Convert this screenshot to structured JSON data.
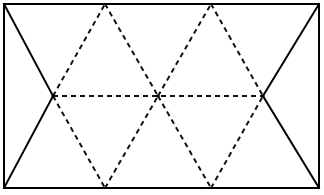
{
  "figure": {
    "background_color": "#ffffff",
    "solid_stroke_color": "#000000",
    "dashed_stroke_color": "#111111",
    "stroke_width": 2,
    "dash_pattern": "5 4",
    "canvas": {
      "width": 324,
      "height": 195
    },
    "points": {
      "top_left": {
        "x": 4,
        "y": 4,
        "label": "top-left-corner"
      },
      "top_apex_1": {
        "x": 105,
        "y": 4,
        "label": "top-apex-left"
      },
      "top_apex_2": {
        "x": 211,
        "y": 4,
        "label": "top-apex-right"
      },
      "top_right": {
        "x": 319,
        "y": 4,
        "label": "top-right-corner"
      },
      "mid_left": {
        "x": 53,
        "y": 96,
        "label": "mid-left-vertex"
      },
      "mid_center": {
        "x": 158,
        "y": 96,
        "label": "mid-center-vertex"
      },
      "mid_right": {
        "x": 263,
        "y": 96,
        "label": "mid-right-vertex"
      },
      "bottom_left": {
        "x": 4,
        "y": 188,
        "label": "bottom-left-corner"
      },
      "bottom_apex_1": {
        "x": 105,
        "y": 188,
        "label": "bottom-apex-left"
      },
      "bottom_apex_2": {
        "x": 211,
        "y": 188,
        "label": "bottom-apex-right"
      },
      "bottom_right": {
        "x": 319,
        "y": 188,
        "label": "bottom-right-corner"
      }
    },
    "solid_segments": [
      {
        "name": "top-edge",
        "x1": 4,
        "y1": 4,
        "x2": 319,
        "y2": 4
      },
      {
        "name": "bottom-edge",
        "x1": 4,
        "y1": 188,
        "x2": 319,
        "y2": 188
      },
      {
        "name": "left-vertical-edge",
        "x1": 4,
        "y1": 4,
        "x2": 4,
        "y2": 188
      },
      {
        "name": "right-vertical-edge",
        "x1": 319,
        "y1": 4,
        "x2": 319,
        "y2": 188
      },
      {
        "name": "left-upper-diagonal",
        "x1": 4,
        "y1": 4,
        "x2": 53,
        "y2": 96
      },
      {
        "name": "left-lower-diagonal",
        "x1": 53,
        "y1": 96,
        "x2": 4,
        "y2": 188
      },
      {
        "name": "right-upper-diagonal",
        "x1": 319,
        "y1": 4,
        "x2": 263,
        "y2": 96
      },
      {
        "name": "right-lower-diagonal",
        "x1": 263,
        "y1": 96,
        "x2": 319,
        "y2": 188
      }
    ],
    "dashed_segments": [
      {
        "name": "mid-horizontal",
        "x1": 53,
        "y1": 96,
        "x2": 263,
        "y2": 96
      },
      {
        "name": "up-left-1",
        "x1": 53,
        "y1": 96,
        "x2": 105,
        "y2": 4
      },
      {
        "name": "down-right-1",
        "x1": 105,
        "y1": 4,
        "x2": 158,
        "y2": 96
      },
      {
        "name": "up-left-2",
        "x1": 158,
        "y1": 96,
        "x2": 211,
        "y2": 4
      },
      {
        "name": "down-right-2",
        "x1": 211,
        "y1": 4,
        "x2": 263,
        "y2": 96
      },
      {
        "name": "down-left-1",
        "x1": 53,
        "y1": 96,
        "x2": 105,
        "y2": 188
      },
      {
        "name": "up-right-1",
        "x1": 105,
        "y1": 188,
        "x2": 158,
        "y2": 96
      },
      {
        "name": "down-left-2",
        "x1": 158,
        "y1": 96,
        "x2": 211,
        "y2": 188
      },
      {
        "name": "up-right-2",
        "x1": 211,
        "y1": 188,
        "x2": 263,
        "y2": 96
      }
    ]
  }
}
